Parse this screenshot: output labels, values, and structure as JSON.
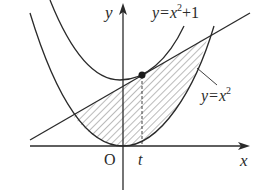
{
  "diagram": {
    "axes": {
      "x_label": "x",
      "y_label": "y",
      "origin_label": "O"
    },
    "curves": [
      {
        "name": "upper-parabola",
        "label": "y=x²+1",
        "equation": "y = x^2 + 1"
      },
      {
        "name": "lower-parabola",
        "label": "y=x²",
        "equation": "y = x^2"
      },
      {
        "name": "tangent-line",
        "label": "",
        "equation": "tangent to y = x^2 + 1 at x = t"
      }
    ],
    "labels": {
      "upper_curve_prefix": "y=x",
      "upper_curve_exp": "2",
      "upper_curve_suffix": "+1",
      "lower_curve_prefix": "y=x",
      "lower_curve_exp": "2",
      "t_label": "t"
    },
    "tangent_point": {
      "label": "",
      "x_param": "t"
    },
    "shaded_region": "region between tangent line and y = x^2",
    "colors": {
      "line": "#2a2a2a",
      "hatch": "#555555",
      "background": "#ffffff"
    }
  }
}
